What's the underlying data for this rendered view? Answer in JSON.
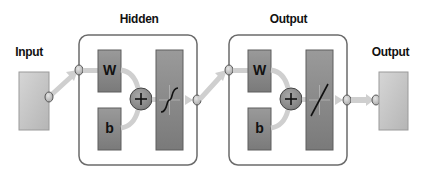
{
  "diagram": {
    "title_type": "neural network architecture",
    "labels": {
      "input": "Input",
      "hidden_layer": "Hidden",
      "output_layer": "Output",
      "output": "Output"
    },
    "layers": [
      {
        "name": "Hidden",
        "weight": "W",
        "bias": "b",
        "sum": "+",
        "activation": "sigmoid"
      },
      {
        "name": "Output",
        "weight": "W",
        "bias": "b",
        "sum": "+",
        "activation": "linear"
      }
    ],
    "colors": {
      "layer_box_border": "#6b6b6b",
      "block_fill": "#8a8a8a",
      "block_dark": "#6e6e6e",
      "io_block_fill": "#c7c7c7",
      "connector_fill": "#cfcfcf",
      "node_fill": "#bdbdbd"
    }
  }
}
